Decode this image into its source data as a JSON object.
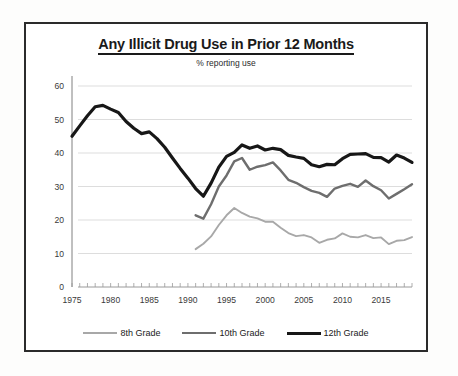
{
  "chart_data": {
    "type": "line",
    "title": "Any Illicit Drug Use in Prior 12 Months",
    "subtitle": "% reporting use",
    "xlabel": "",
    "ylabel": "",
    "ylim": [
      0,
      60
    ],
    "yticks": [
      0,
      10,
      20,
      30,
      40,
      50,
      60
    ],
    "xlim": [
      1975,
      2019
    ],
    "xticks": [
      1975,
      1980,
      1985,
      1990,
      1995,
      2000,
      2005,
      2010,
      2015
    ],
    "grid": "horizontal",
    "legend_position": "bottom",
    "x": [
      1975,
      1976,
      1977,
      1978,
      1979,
      1980,
      1981,
      1982,
      1983,
      1984,
      1985,
      1986,
      1987,
      1988,
      1989,
      1990,
      1991,
      1992,
      1993,
      1994,
      1995,
      1996,
      1997,
      1998,
      1999,
      2000,
      2001,
      2002,
      2003,
      2004,
      2005,
      2006,
      2007,
      2008,
      2009,
      2010,
      2011,
      2012,
      2013,
      2014,
      2015,
      2016,
      2017,
      2018,
      2019
    ],
    "series": [
      {
        "name": "8th Grade",
        "color": "#a8a8a8",
        "x": [
          1991,
          1992,
          1993,
          1994,
          1995,
          1996,
          1997,
          1998,
          1999,
          2000,
          2001,
          2002,
          2003,
          2004,
          2005,
          2006,
          2007,
          2008,
          2009,
          2010,
          2011,
          2012,
          2013,
          2014,
          2015,
          2016,
          2017,
          2018,
          2019
        ],
        "values": [
          11.3,
          12.9,
          15.1,
          18.5,
          21.4,
          23.6,
          22.1,
          21.0,
          20.5,
          19.5,
          19.5,
          17.7,
          16.1,
          15.2,
          15.5,
          14.8,
          13.2,
          14.1,
          14.5,
          16.0,
          15.0,
          14.8,
          15.5,
          14.6,
          14.8,
          12.8,
          13.8,
          14.0,
          14.9
        ]
      },
      {
        "name": "10th Grade",
        "color": "#6e6e6e",
        "x": [
          1991,
          1992,
          1993,
          1994,
          1995,
          1996,
          1997,
          1998,
          1999,
          2000,
          2001,
          2002,
          2003,
          2004,
          2005,
          2006,
          2007,
          2008,
          2009,
          2010,
          2011,
          2012,
          2013,
          2014,
          2015,
          2016,
          2017,
          2018,
          2019
        ],
        "values": [
          21.4,
          20.4,
          24.7,
          30.0,
          33.3,
          37.5,
          38.5,
          35.0,
          35.9,
          36.4,
          37.2,
          34.8,
          32.0,
          31.1,
          29.8,
          28.7,
          28.1,
          26.9,
          29.4,
          30.2,
          30.8,
          29.9,
          31.8,
          30.1,
          28.9,
          26.4,
          27.8,
          29.2,
          30.7
        ]
      },
      {
        "name": "12th Grade",
        "color": "#171717",
        "x": [
          1975,
          1976,
          1977,
          1978,
          1979,
          1980,
          1981,
          1982,
          1983,
          1984,
          1985,
          1986,
          1987,
          1988,
          1989,
          1990,
          1991,
          1992,
          1993,
          1994,
          1995,
          1996,
          1997,
          1998,
          1999,
          2000,
          2001,
          2002,
          2003,
          2004,
          2005,
          2006,
          2007,
          2008,
          2009,
          2010,
          2011,
          2012,
          2013,
          2014,
          2015,
          2016,
          2017,
          2018,
          2019
        ],
        "values": [
          45.0,
          48.1,
          51.1,
          53.8,
          54.2,
          53.1,
          52.1,
          49.4,
          47.4,
          45.8,
          46.3,
          44.3,
          41.7,
          38.5,
          35.4,
          32.5,
          29.4,
          27.1,
          31.0,
          35.8,
          39.0,
          40.2,
          42.4,
          41.4,
          42.1,
          40.9,
          41.4,
          41.0,
          39.3,
          38.8,
          38.4,
          36.5,
          35.9,
          36.6,
          36.5,
          38.3,
          39.6,
          39.7,
          39.8,
          38.7,
          38.6,
          37.3,
          39.4,
          38.5,
          37.2
        ]
      }
    ]
  },
  "legend": {
    "items": [
      {
        "label": "8th Grade"
      },
      {
        "label": "10th Grade"
      },
      {
        "label": "12th Grade"
      }
    ]
  },
  "axis": {
    "y_tick_labels": [
      "0",
      "10",
      "20",
      "30",
      "40",
      "50",
      "60"
    ],
    "x_tick_labels": [
      "1975",
      "1980",
      "1985",
      "1990",
      "1995",
      "2000",
      "2005",
      "2010",
      "2015"
    ]
  }
}
